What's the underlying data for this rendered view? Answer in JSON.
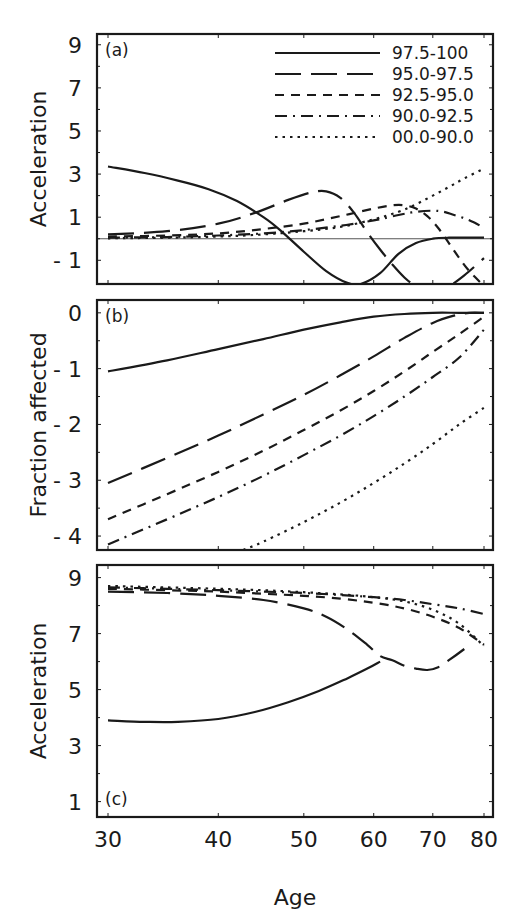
{
  "chart_data": {
    "type": "line",
    "x_scale": "log",
    "xlabel": "Age",
    "x_ticks": [
      30,
      40,
      50,
      60,
      70,
      80
    ],
    "xlim": [
      30,
      80
    ],
    "legend": {
      "position": "upper right of panel (a)",
      "entries": [
        {
          "label": "97.5-100",
          "style": "solid"
        },
        {
          "label": "95.0-97.5",
          "style": "long-dash"
        },
        {
          "label": "92.5-95.0",
          "style": "dash"
        },
        {
          "label": "90.0-92.5",
          "style": "dash-dot"
        },
        {
          "label": "00.0-90.0",
          "style": "dotted"
        }
      ]
    },
    "panels": [
      {
        "id": "a",
        "panel_label": "(a)",
        "ylabel": "Acceleration",
        "ylim": [
          -2.1,
          9.5
        ],
        "y_ticks": [
          9,
          7,
          5,
          3,
          1,
          -1
        ],
        "y_tick_labels": [
          "9",
          "7",
          "5",
          "3",
          "1",
          "- 1"
        ],
        "reference_line": 0,
        "series": [
          {
            "name": "97.5-100",
            "style": "solid",
            "x": [
              30,
              33,
              36,
              39,
              42,
              45,
              47,
              50,
              53,
              56,
              58,
              61,
              64,
              67,
              70,
              73,
              76,
              80
            ],
            "y": [
              3.35,
              3.05,
              2.7,
              2.3,
              1.75,
              1.0,
              0.4,
              -0.6,
              -1.5,
              -2.05,
              -2.1,
              -1.6,
              -0.7,
              -0.2,
              0.0,
              0.05,
              0.05,
              0.05
            ]
          },
          {
            "name": "95.0-97.5",
            "style": "long-dash",
            "x": [
              30,
              35,
              40,
              44,
              48,
              51,
              53,
              55,
              57,
              59,
              61,
              63,
              65,
              67,
              69,
              71,
              73,
              76,
              80
            ],
            "y": [
              0.2,
              0.35,
              0.7,
              1.2,
              1.8,
              2.15,
              2.2,
              1.9,
              1.2,
              0.3,
              -0.5,
              -1.2,
              -1.8,
              -2.2,
              -2.3,
              -2.3,
              -2.2,
              -1.7,
              -0.9
            ]
          },
          {
            "name": "92.5-95.0",
            "style": "dash",
            "x": [
              30,
              35,
              40,
              45,
              50,
              55,
              60,
              63,
              65,
              67,
              69,
              71,
              73,
              75,
              77,
              80
            ],
            "y": [
              0.1,
              0.15,
              0.25,
              0.45,
              0.7,
              1.05,
              1.4,
              1.55,
              1.55,
              1.4,
              1.05,
              0.5,
              -0.2,
              -0.9,
              -1.5,
              -2.2
            ]
          },
          {
            "name": "90.0-92.5",
            "style": "dash-dot",
            "x": [
              30,
              35,
              40,
              45,
              50,
              55,
              60,
              64,
              67,
              70,
              72,
              74,
              76,
              78,
              80
            ],
            "y": [
              0.05,
              0.08,
              0.15,
              0.25,
              0.4,
              0.6,
              0.85,
              1.1,
              1.25,
              1.3,
              1.25,
              1.1,
              0.95,
              0.75,
              0.5
            ]
          },
          {
            "name": "00.0-90.0",
            "style": "dotted",
            "x": [
              30,
              35,
              40,
              45,
              50,
              55,
              60,
              64,
              67,
              70,
              73,
              76,
              80
            ],
            "y": [
              0.02,
              0.05,
              0.1,
              0.2,
              0.35,
              0.55,
              0.9,
              1.25,
              1.6,
              2.0,
              2.4,
              2.8,
              3.25
            ]
          }
        ]
      },
      {
        "id": "b",
        "panel_label": "(b)",
        "ylabel": "Fraction affected",
        "ylim": [
          -4.25,
          0.23
        ],
        "y_ticks": [
          0,
          -1,
          -2,
          -3,
          -4
        ],
        "y_tick_labels": [
          "0",
          "- 1",
          "- 2",
          "- 3",
          "- 4"
        ],
        "series": [
          {
            "name": "97.5-100",
            "style": "solid",
            "x": [
              30,
              35,
              40,
              45,
              50,
              55,
              60,
              65,
              70,
              75,
              80
            ],
            "y": [
              -1.05,
              -0.85,
              -0.65,
              -0.47,
              -0.3,
              -0.17,
              -0.07,
              -0.02,
              0.0,
              0.0,
              0.0
            ]
          },
          {
            "name": "95.0-97.5",
            "style": "long-dash",
            "x": [
              30,
              35,
              40,
              45,
              50,
              55,
              60,
              65,
              70,
              74,
              77,
              80
            ],
            "y": [
              -3.05,
              -2.6,
              -2.2,
              -1.82,
              -1.47,
              -1.12,
              -0.78,
              -0.45,
              -0.18,
              -0.05,
              0.0,
              0.0
            ]
          },
          {
            "name": "92.5-95.0",
            "style": "dash",
            "x": [
              30,
              35,
              40,
              45,
              50,
              55,
              60,
              65,
              70,
              75,
              80
            ],
            "y": [
              -3.7,
              -3.25,
              -2.85,
              -2.47,
              -2.1,
              -1.75,
              -1.4,
              -1.05,
              -0.7,
              -0.38,
              -0.07
            ]
          },
          {
            "name": "90.0-92.5",
            "style": "dash-dot",
            "x": [
              30,
              35,
              40,
              45,
              50,
              55,
              60,
              65,
              70,
              75,
              80
            ],
            "y": [
              -4.15,
              -3.7,
              -3.3,
              -2.92,
              -2.55,
              -2.2,
              -1.85,
              -1.5,
              -1.15,
              -0.8,
              -0.3
            ]
          },
          {
            "name": "00.0-90.0",
            "style": "dotted",
            "x": [
              42.7,
              45,
              50,
              55,
              60,
              65,
              70,
              75,
              80
            ],
            "y": [
              -4.25,
              -4.1,
              -3.75,
              -3.4,
              -3.05,
              -2.7,
              -2.35,
              -2.0,
              -1.7
            ]
          }
        ]
      },
      {
        "id": "c",
        "panel_label": "(c)",
        "ylabel": "Acceleration",
        "ylim": [
          0.45,
          9.45
        ],
        "y_ticks": [
          9,
          7,
          5,
          3,
          1
        ],
        "y_tick_labels": [
          "9",
          "7",
          "5",
          "3",
          "1"
        ],
        "series": [
          {
            "name": "97.5-100",
            "style": "solid",
            "x": [
              30,
              33,
              36,
              40,
              44,
              48,
              52,
              56,
              59,
              61
            ],
            "y": [
              3.9,
              3.85,
              3.85,
              3.95,
              4.2,
              4.55,
              4.95,
              5.4,
              5.75,
              6.0
            ]
          },
          {
            "name": "95.0-97.5",
            "style": "long-dash",
            "x": [
              30,
              35,
              40,
              45,
              50,
              53,
              56,
              59,
              61,
              63,
              65,
              67,
              69,
              71,
              73,
              76
            ],
            "y": [
              8.5,
              8.45,
              8.35,
              8.2,
              7.9,
              7.6,
              7.15,
              6.6,
              6.2,
              6.05,
              5.85,
              5.75,
              5.7,
              5.8,
              6.05,
              6.45
            ]
          },
          {
            "name": "92.5-95.0",
            "style": "dash",
            "x": [
              30,
              35,
              40,
              45,
              50,
              55,
              60,
              65,
              70,
              75,
              80
            ],
            "y": [
              8.6,
              8.55,
              8.5,
              8.42,
              8.35,
              8.25,
              8.1,
              7.9,
              7.6,
              7.2,
              6.6
            ]
          },
          {
            "name": "90.0-92.5",
            "style": "dash-dot",
            "x": [
              30,
              35,
              40,
              45,
              50,
              55,
              60,
              65,
              70,
              75,
              80
            ],
            "y": [
              8.65,
              8.6,
              8.55,
              8.5,
              8.45,
              8.38,
              8.3,
              8.2,
              8.05,
              7.9,
              7.7
            ]
          },
          {
            "name": "00.0-90.0",
            "style": "dotted",
            "x": [
              30,
              35,
              40,
              45,
              50,
              55,
              60,
              65,
              70,
              75,
              80
            ],
            "y": [
              8.7,
              8.65,
              8.6,
              8.55,
              8.48,
              8.4,
              8.3,
              8.15,
              7.85,
              7.35,
              6.55
            ]
          }
        ]
      }
    ]
  },
  "layout": {
    "frame_left": 97,
    "frame_right": 493,
    "plot_x_start": 108,
    "plot_x_end": 484,
    "panels_px": [
      {
        "top": 34,
        "bottom": 284
      },
      {
        "top": 300,
        "bottom": 550
      },
      {
        "top": 565,
        "bottom": 817
      }
    ]
  },
  "styles": {
    "solid": "",
    "long-dash": "26 10",
    "dash": "9 7",
    "dash-dot": "12 6 2 6",
    "dotted": "2.5 5"
  }
}
